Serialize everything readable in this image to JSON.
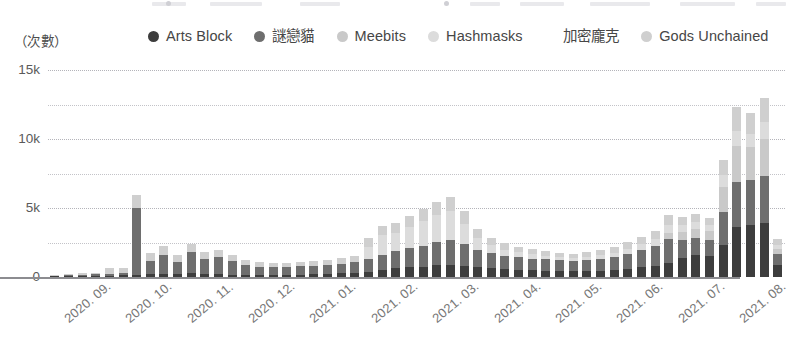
{
  "unit_caption": "（次數）",
  "legend": {
    "items": [
      {
        "label": "Arts Block",
        "color": "#3d3d3d",
        "name": "legend-arts-block"
      },
      {
        "label": "謎戀貓",
        "color": "#6e6e6e",
        "name": "legend-cryptokitties"
      },
      {
        "label": "Meebits",
        "color": "#c9c9c9",
        "name": "legend-meebits"
      },
      {
        "label": "Hashmasks",
        "color": "#dcdcdc",
        "name": "legend-hashmasks"
      },
      {
        "label": "加密龐克",
        "color": "#ffffff",
        "name": "legend-cryptopunks"
      },
      {
        "label": "Gods Unchained",
        "color": "#cfcfcf",
        "name": "legend-gods-unchained"
      }
    ]
  },
  "yaxis": {
    "ticks": [
      "0",
      "5k",
      "10k",
      "15k"
    ],
    "tick_values": [
      0,
      5000,
      10000,
      15000
    ],
    "minor_values": [
      2500,
      7500,
      12500
    ],
    "min": 0,
    "max": 15000
  },
  "xaxis": {
    "labels": [
      "2020. 09.",
      "2020. 10.",
      "2020. 11.",
      "2020. 12.",
      "2021. 01.",
      "2021. 02.",
      "2021. 03.",
      "2021. 04.",
      "2021. 05.",
      "2021. 06.",
      "2021. 07.",
      "2021. 08."
    ]
  },
  "chart_data": {
    "type": "bar",
    "stacked": true,
    "title": "",
    "subtitle": "",
    "xlabel": "",
    "ylabel": "（次數）",
    "ylim": [
      0,
      15000
    ],
    "grid": true,
    "legend_position": "top",
    "x_tick_labels": [
      "2020. 09.",
      "2020. 10.",
      "2020. 11.",
      "2020. 12.",
      "2021. 01.",
      "2021. 02.",
      "2021. 03.",
      "2021. 04.",
      "2021. 05.",
      "2021. 06.",
      "2021. 07.",
      "2021. 08."
    ],
    "categories": [
      "2020-09-w1",
      "2020-09-w2",
      "2020-09-w3",
      "2020-09-w4",
      "2020-09-w5",
      "2020-10-w1",
      "2020-10-w2",
      "2020-10-w3",
      "2020-10-w4",
      "2020-10-w5",
      "2020-11-w1",
      "2020-11-w2",
      "2020-11-w3",
      "2020-11-w4",
      "2020-12-w1",
      "2020-12-w2",
      "2020-12-w3",
      "2020-12-w4",
      "2020-12-w5",
      "2021-01-w1",
      "2021-01-w2",
      "2021-01-w3",
      "2021-01-w4",
      "2021-02-w1",
      "2021-02-w2",
      "2021-02-w3",
      "2021-02-w4",
      "2021-03-w1",
      "2021-03-w2",
      "2021-03-w3",
      "2021-03-w4",
      "2021-03-w5",
      "2021-04-w1",
      "2021-04-w2",
      "2021-04-w3",
      "2021-04-w4",
      "2021-05-w1",
      "2021-05-w2",
      "2021-05-w3",
      "2021-05-w4",
      "2021-05-w5",
      "2021-06-w1",
      "2021-06-w2",
      "2021-06-w3",
      "2021-06-w4",
      "2021-07-w1",
      "2021-07-w2",
      "2021-07-w3",
      "2021-07-w4",
      "2021-07-w5",
      "2021-08-w1",
      "2021-08-w2",
      "2021-08-w3",
      "2021-08-w4"
    ],
    "series": [
      {
        "name": "Arts Block",
        "color": "#3d3d3d",
        "values": [
          40,
          60,
          60,
          70,
          80,
          110,
          180,
          250,
          220,
          200,
          260,
          230,
          200,
          180,
          170,
          160,
          150,
          160,
          170,
          190,
          230,
          260,
          300,
          380,
          520,
          640,
          700,
          760,
          860,
          900,
          820,
          700,
          620,
          560,
          520,
          480,
          460,
          430,
          420,
          440,
          460,
          520,
          600,
          700,
          820,
          980,
          1400,
          1600,
          1500,
          2300,
          3600,
          3800,
          3900,
          900
        ]
      },
      {
        "name": "謎戀貓",
        "color": "#6e6e6e",
        "values": [
          60,
          90,
          110,
          120,
          140,
          200,
          4800,
          900,
          1400,
          900,
          1550,
          1100,
          1250,
          1000,
          700,
          600,
          560,
          580,
          600,
          620,
          660,
          700,
          760,
          900,
          1100,
          1250,
          1400,
          1500,
          1700,
          1750,
          1550,
          1250,
          1100,
          980,
          900,
          860,
          820,
          780,
          760,
          800,
          860,
          950,
          1100,
          1250,
          1450,
          1800,
          1250,
          1200,
          1150,
          2400,
          3300,
          3200,
          3400,
          800
        ]
      },
      {
        "name": "Meebits",
        "color": "#c9c9c9",
        "values": [
          0,
          0,
          0,
          0,
          0,
          0,
          0,
          0,
          0,
          0,
          0,
          0,
          0,
          0,
          0,
          0,
          0,
          0,
          0,
          0,
          0,
          0,
          0,
          0,
          0,
          0,
          0,
          0,
          0,
          0,
          0,
          0,
          0,
          0,
          0,
          0,
          0,
          0,
          0,
          0,
          0,
          0,
          0,
          0,
          0,
          400,
          600,
          700,
          650,
          1800,
          2600,
          2400,
          2700,
          350
        ]
      },
      {
        "name": "Hashmasks",
        "color": "#dcdcdc",
        "values": [
          0,
          0,
          0,
          0,
          0,
          0,
          0,
          0,
          0,
          0,
          0,
          0,
          0,
          0,
          0,
          0,
          0,
          0,
          0,
          0,
          0,
          0,
          0,
          900,
          1400,
          1300,
          1500,
          1800,
          1900,
          2100,
          1500,
          900,
          600,
          450,
          380,
          320,
          260,
          220,
          200,
          220,
          260,
          300,
          360,
          420,
          500,
          600,
          500,
          480,
          440,
          900,
          1100,
          1000,
          1200,
          280
        ]
      },
      {
        "name": "加密龐克",
        "color": "#ffffff",
        "values": [
          0,
          0,
          0,
          0,
          0,
          0,
          0,
          0,
          0,
          0,
          0,
          0,
          0,
          0,
          0,
          0,
          0,
          0,
          0,
          0,
          0,
          0,
          0,
          0,
          0,
          0,
          0,
          0,
          0,
          0,
          0,
          0,
          0,
          0,
          0,
          0,
          0,
          0,
          0,
          0,
          0,
          0,
          0,
          0,
          0,
          0,
          0,
          0,
          0,
          0,
          0,
          0,
          0,
          0
        ]
      },
      {
        "name": "Gods Unchained",
        "color": "#cfcfcf",
        "values": [
          80,
          100,
          110,
          130,
          420,
          340,
          1000,
          620,
          640,
          520,
          620,
          480,
          520,
          440,
          330,
          300,
          280,
          290,
          310,
          330,
          380,
          420,
          480,
          620,
          700,
          760,
          820,
          900,
          980,
          1050,
          880,
          620,
          520,
          450,
          400,
          360,
          340,
          310,
          300,
          320,
          350,
          400,
          460,
          520,
          600,
          700,
          600,
          560,
          520,
          1100,
          1700,
          1500,
          1750,
          400
        ]
      }
    ],
    "totals": [
      180,
      250,
      280,
      320,
      640,
      650,
      5980,
      1770,
      2260,
      1620,
      2430,
      1810,
      1970,
      1620,
      1200,
      1060,
      990,
      1030,
      1080,
      1140,
      1270,
      1380,
      1540,
      2800,
      3720,
      3950,
      4420,
      4960,
      5440,
      5800,
      4750,
      3470,
      2840,
      2440,
      2200,
      2020,
      1880,
      1740,
      1680,
      1780,
      1930,
      2170,
      2520,
      2890,
      3370,
      4480,
      4350,
      4540,
      4260,
      8500,
      12300,
      11900,
      12950,
      2730
    ]
  }
}
